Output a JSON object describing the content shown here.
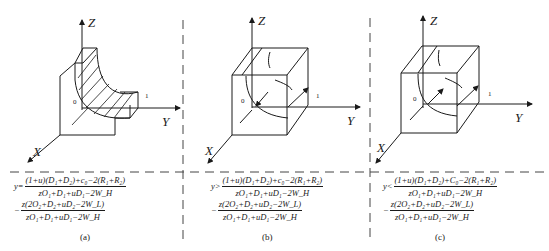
{
  "axes": {
    "x": "X",
    "y": "Y",
    "z": "Z",
    "origin": "0",
    "unit": "1"
  },
  "panels": [
    {
      "id": "a",
      "caption": "(a)",
      "relation": "y=",
      "fraction1": {
        "numerator": "(1+u)(D₁+D₂)+c₀−2(R₁+R₂)",
        "denominator": "zO₁+D₁+uD₁−2W_H"
      },
      "fraction2": {
        "prefix": "−",
        "numerator": "z(2O₂+D₂+uD₂−2W_L)",
        "denominator": "zO₁+D₁+uD₁−2W_H"
      },
      "shape": "hatched curved surface region"
    },
    {
      "id": "b",
      "caption": "(b)",
      "relation": "y>",
      "fraction1": {
        "numerator": "(1+u)(D₁+D₂)+c₀−2(R₁+R₂)",
        "denominator": "zO₁+D₁+uD₁−2W_H"
      },
      "fraction2": {
        "prefix": "−",
        "numerator": "z(2O₂+D₂+uD₂−2W_L)",
        "denominator": "zO₁+D₁+uD₁−2W_H"
      },
      "shape": "cube with inward arrow"
    },
    {
      "id": "c",
      "caption": "(c)",
      "relation": "y<",
      "fraction1": {
        "numerator": "(1+u)(D₁+D₂)+C₀−2(R₁+R₂)",
        "denominator": "zO₁+D₁+uD₁−2W_H"
      },
      "fraction2": {
        "prefix": "−",
        "numerator": "z(2O₂+D₂+uD₂−2W_L)",
        "denominator": "zO₁+D₁+uD₁−2W_H"
      },
      "shape": "cube with outward arrow"
    }
  ]
}
